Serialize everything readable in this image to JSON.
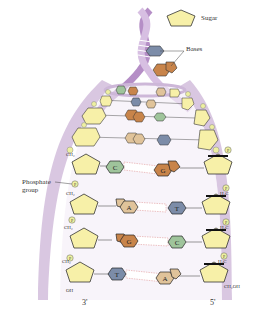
{
  "legend": {
    "sugar_label": "Sugar",
    "bases_label": "Bases"
  },
  "labels": {
    "phosphate_group_line1": "Phosphate",
    "phosphate_group_line2": "group",
    "end_left": "3'",
    "end_right": "5'",
    "oh": "OH",
    "ch2oh": "CH₂OH",
    "ch2": "CH₂",
    "h2c": "H₂C",
    "p": "P"
  },
  "base_pairs": [
    {
      "left": "C",
      "right": "G"
    },
    {
      "left": "A",
      "right": "T"
    },
    {
      "left": "G",
      "right": "C"
    },
    {
      "left": "T",
      "right": "A"
    }
  ],
  "colors": {
    "sugar": "#f7f0a8",
    "backbone": "#c9b3d3",
    "backbone_dark": "#9b7fae",
    "base_C": "#9fc49b",
    "base_G": "#c8844a",
    "base_A": "#e0c39a",
    "base_T": "#7c8ca8",
    "phosphate": "#eef0a0"
  }
}
